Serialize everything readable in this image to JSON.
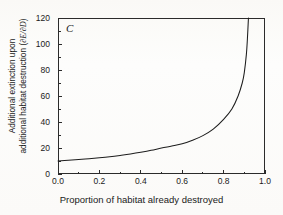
{
  "figure": {
    "panel_label": "C",
    "background_color": "#fdfdfc",
    "axis_color": "#2b2b2b",
    "curve_color": "#1d1d1d"
  },
  "chart_data": {
    "type": "line",
    "title": "",
    "subtitle": "",
    "panel": "C",
    "xlabel": "Proportion of habitat already destroyed",
    "ylabel": "Additional extinction upon additional habitat destruction (∂E/∂D)",
    "ylabel_line1": "Additional extinction upon",
    "ylabel_line2_prefix": "additional habitat destruction (",
    "ylabel_line2_symbol": "∂E/∂D",
    "ylabel_line2_suffix": ")",
    "xlim": [
      0.0,
      1.0
    ],
    "ylim": [
      0,
      120
    ],
    "grid": false,
    "legend": false,
    "legend_position": "none",
    "tick_direction": "in",
    "xticks": [
      0.0,
      0.2,
      0.4,
      0.6,
      0.8,
      1.0
    ],
    "xtick_labels": [
      "0.0",
      "0.2",
      "0.4",
      "0.6",
      "0.8",
      "1.0"
    ],
    "x_minor_ticks": [
      0.1,
      0.3,
      0.5,
      0.7,
      0.9
    ],
    "yticks": [
      0,
      20,
      40,
      60,
      80,
      100,
      120
    ],
    "ytick_labels": [
      "0",
      "20",
      "40",
      "60",
      "80",
      "100",
      "120"
    ],
    "y_minor_ticks": [
      10,
      30,
      50,
      70,
      90,
      110
    ],
    "series": [
      {
        "name": "Additional extinction rate",
        "x": [
          0.0,
          0.05,
          0.1,
          0.15,
          0.2,
          0.25,
          0.3,
          0.35,
          0.4,
          0.45,
          0.5,
          0.55,
          0.6,
          0.65,
          0.7,
          0.75,
          0.8,
          0.84,
          0.87,
          0.89,
          0.9,
          0.91,
          0.915,
          0.92
        ],
        "values": [
          10.0,
          10.5,
          11.1,
          11.8,
          12.5,
          13.3,
          14.3,
          15.4,
          16.7,
          18.2,
          20.0,
          21.5,
          23.2,
          26.0,
          29.5,
          34.5,
          42.0,
          50.0,
          60.0,
          70.0,
          78.0,
          92.0,
          104.0,
          120.0
        ],
        "clipped_at_top": true,
        "exit_x": 0.92,
        "exit_y": 120
      }
    ],
    "annotations": [
      {
        "text": "C",
        "x": 0.04,
        "y": 112,
        "style": "italic"
      }
    ]
  }
}
